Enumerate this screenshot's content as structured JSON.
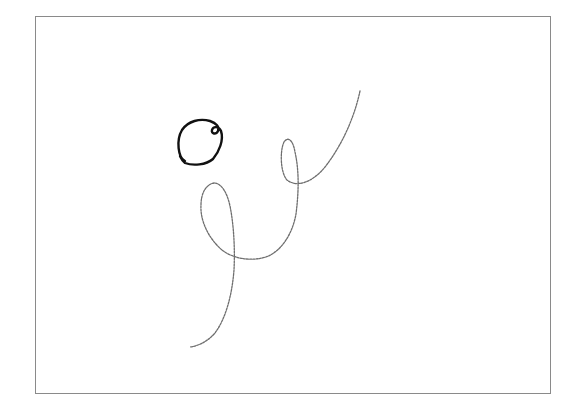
{
  "canvas": {
    "frame": {
      "x": 35,
      "y": 16,
      "width": 516,
      "height": 378,
      "border_color": "#8a8a8a"
    },
    "background": "#ffffff"
  },
  "strokes": [
    {
      "name": "small-dark-loop",
      "color": "#111111",
      "width": 2.4,
      "opacity": 1,
      "path": "M 185 161 C 178 158, 176 140, 182 130 C 188 121, 200 118, 210 121 C 216 123, 220 127, 218 131 C 216 135, 211 134, 212 130 C 213 126, 219 126, 221 131 C 224 140, 219 152, 213 159 C 206 165, 193 166, 185 163 C 182 161, 181 158, 180 156"
    },
    {
      "name": "long-faint-trajectory",
      "color": "#555555",
      "width": 1.3,
      "opacity": 0.85,
      "dasharray": "2 1.2",
      "path": "M 360 91 C 356 110, 346 140, 325 167 C 313 182, 297 188, 287 180 C 280 172, 280 150, 284 142 C 288 136, 293 140, 295 152 C 299 170, 299 190, 296 214 C 292 236, 280 252, 266 257 C 250 262, 232 258, 222 250 C 208 238, 200 220, 201 205 C 201 192, 207 184, 214 183 C 221 183, 227 192, 230 206 C 234 226, 235 250, 234 270 C 232 295, 226 318, 215 333 C 207 342, 198 346, 190 347"
    }
  ]
}
